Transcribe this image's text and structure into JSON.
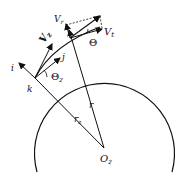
{
  "diagram": {
    "labels": {
      "i": "i",
      "k": "k",
      "j": "j",
      "V_z": "V",
      "V_z_sub": "z",
      "V_r": "V",
      "V_r_sub": "r",
      "V_t": "V",
      "V_t_sub": "t",
      "Theta": "Θ",
      "Theta_z": "Θ",
      "Theta_z_sub": "z",
      "r": "r",
      "r_z": "r",
      "r_z_sub": "z",
      "O_z": "O",
      "O_z_sub": "z"
    },
    "colors": {
      "stroke": "#111111",
      "background": "#ffffff"
    }
  }
}
